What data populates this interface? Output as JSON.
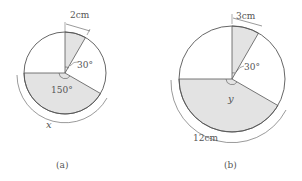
{
  "figures": [
    {
      "id": "a",
      "caption": "(a)",
      "small_sector": {
        "angle_label": "30°",
        "arc_label": "2cm"
      },
      "large_sector": {
        "angle_label": "150°",
        "arc_label": "x"
      }
    },
    {
      "id": "b",
      "caption": "(b)",
      "small_sector": {
        "angle_label": "30°",
        "arc_label": "3cm"
      },
      "large_sector": {
        "angle_label": "y",
        "arc_label": "12cm"
      }
    }
  ],
  "colors": {
    "shade": "#e3e3e3",
    "line": "#555555"
  }
}
